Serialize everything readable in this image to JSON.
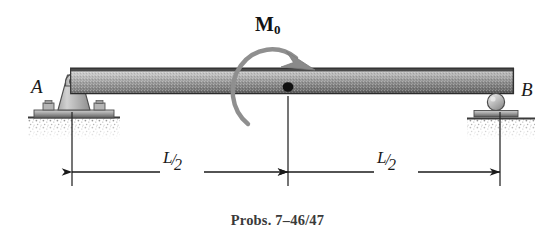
{
  "figure": {
    "caption": "Probs. 7–46/47",
    "background_color": "#ffffff"
  },
  "beam": {
    "label_left_support": "A",
    "label_right_support": "B",
    "top_edge_color": "#3d3d3d",
    "body_color_light": "#c9c9c9",
    "body_color_dark": "#6e6e6e"
  },
  "load": {
    "moment_symbol": "M",
    "moment_subscript": "0",
    "direction": "clockwise",
    "arc_color": "#8a8a8a"
  },
  "supports": {
    "left": {
      "type": "pin-support",
      "name": "A",
      "bolt_count": 2
    },
    "right": {
      "type": "roller-support",
      "name": "B"
    }
  },
  "dimensions": [
    {
      "name": "left-span",
      "numerator": "L",
      "slash": "/",
      "denominator": "2"
    },
    {
      "name": "right-span",
      "numerator": "L",
      "slash": "/",
      "denominator": "2"
    }
  ]
}
